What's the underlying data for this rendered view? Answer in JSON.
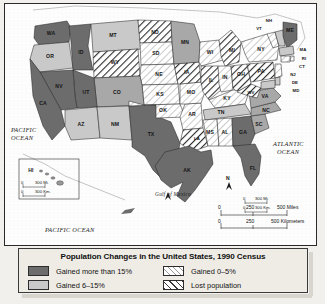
{
  "legend": {
    "title": "Population Changes in the United States, 1990 Census",
    "items": [
      {
        "label": "Gained more than 15%",
        "pattern": "solid-dark",
        "color": "#6c6c6c"
      },
      {
        "label": "Gained 0–5%",
        "pattern": "light-hatch",
        "color": "#ffffff"
      },
      {
        "label": "Gained 6–15%",
        "pattern": "solid-light",
        "color": "#c9c9c9"
      },
      {
        "label": "Lost population",
        "pattern": "dark-hatch",
        "color": "#ffffff"
      }
    ]
  },
  "map": {
    "oceans": [
      {
        "name": "pacific-ocean-west",
        "line1": "PACIFIC",
        "line2": "OCEAN"
      },
      {
        "name": "atlantic-ocean",
        "line1": "ATLANTIC",
        "line2": "OCEAN"
      },
      {
        "name": "pacific-ocean-south",
        "line1": "PACIFIC OCEAN",
        "line2": ""
      },
      {
        "name": "gulf-of-mexico",
        "line1": "Gulf of Mexico",
        "line2": ""
      }
    ],
    "scale_main": {
      "miles": [
        "0",
        "250",
        "500 Miles"
      ],
      "km": [
        "0",
        "250",
        "500 Kilometers"
      ]
    },
    "scale_hi": {
      "miles": [
        "0",
        "300 Mi."
      ],
      "km": [
        "0",
        "300 Km."
      ]
    },
    "scale_ak": {
      "miles": [
        "0",
        "300 Mi."
      ],
      "km": [
        "0",
        "300 Km."
      ]
    },
    "inset_labels": {
      "hawaii": "HI",
      "alaska": "AK"
    },
    "states": [
      {
        "abbr": "WA",
        "class": "dark"
      },
      {
        "abbr": "OR",
        "class": "light"
      },
      {
        "abbr": "ID",
        "class": "dark"
      },
      {
        "abbr": "MT",
        "class": "light"
      },
      {
        "abbr": "ND",
        "class": "lost"
      },
      {
        "abbr": "SD",
        "class": "white"
      },
      {
        "abbr": "MN",
        "class": "mid"
      },
      {
        "abbr": "WI",
        "class": "white"
      },
      {
        "abbr": "MI",
        "class": "lost"
      },
      {
        "abbr": "NY",
        "class": "white"
      },
      {
        "abbr": "VT",
        "class": "white"
      },
      {
        "abbr": "NH",
        "class": "light"
      },
      {
        "abbr": "ME",
        "class": "dark"
      },
      {
        "abbr": "MA",
        "class": "light"
      },
      {
        "abbr": "RI",
        "class": "white"
      },
      {
        "abbr": "CT",
        "class": "white"
      },
      {
        "abbr": "NJ",
        "class": "white"
      },
      {
        "abbr": "DE",
        "class": "light"
      },
      {
        "abbr": "MD",
        "class": "light"
      },
      {
        "abbr": "PA",
        "class": "lost"
      },
      {
        "abbr": "OH",
        "class": "lost"
      },
      {
        "abbr": "IN",
        "class": "white"
      },
      {
        "abbr": "IL",
        "class": "lost"
      },
      {
        "abbr": "IA",
        "class": "lost"
      },
      {
        "abbr": "NE",
        "class": "white"
      },
      {
        "abbr": "WY",
        "class": "lost"
      },
      {
        "abbr": "UT",
        "class": "dark"
      },
      {
        "abbr": "NV",
        "class": "dark"
      },
      {
        "abbr": "CA",
        "class": "dark"
      },
      {
        "abbr": "AZ",
        "class": "light"
      },
      {
        "abbr": "CO",
        "class": "mid"
      },
      {
        "abbr": "KS",
        "class": "white"
      },
      {
        "abbr": "MO",
        "class": "white"
      },
      {
        "abbr": "KY",
        "class": "white"
      },
      {
        "abbr": "WV",
        "class": "lost"
      },
      {
        "abbr": "VA",
        "class": "mid"
      },
      {
        "abbr": "NC",
        "class": "mid"
      },
      {
        "abbr": "SC",
        "class": "mid"
      },
      {
        "abbr": "GA",
        "class": "dark"
      },
      {
        "abbr": "FL",
        "class": "dark"
      },
      {
        "abbr": "AL",
        "class": "white"
      },
      {
        "abbr": "TN",
        "class": "light"
      },
      {
        "abbr": "MS",
        "class": "white"
      },
      {
        "abbr": "AR",
        "class": "white"
      },
      {
        "abbr": "LA",
        "class": "lost"
      },
      {
        "abbr": "OK",
        "class": "white"
      },
      {
        "abbr": "TX",
        "class": "dark"
      },
      {
        "abbr": "NM",
        "class": "light"
      },
      {
        "abbr": "AK",
        "class": "dark"
      },
      {
        "abbr": "HI",
        "class": "white"
      }
    ]
  }
}
